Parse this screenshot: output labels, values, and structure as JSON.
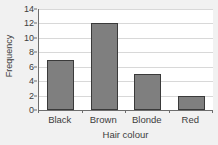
{
  "chart_data": {
    "type": "bar",
    "title": "",
    "subtitle": "",
    "categories": [
      "Black",
      "Brown",
      "Blonde",
      "Red"
    ],
    "values": [
      7,
      12,
      5,
      2
    ],
    "series": [
      {
        "name": "Frequency",
        "values": [
          7,
          12,
          5,
          2
        ]
      }
    ],
    "xlabel": "Hair colour",
    "ylabel": "Frequency",
    "ylim": [
      0,
      14
    ],
    "yticks": [
      0,
      2,
      4,
      6,
      8,
      10,
      12,
      14
    ],
    "ytick_labels": [
      "0",
      "2",
      "4",
      "6",
      "8",
      "10",
      "12",
      "14"
    ],
    "grid": true,
    "grid_axis": "y",
    "legend": false,
    "legend_position": "none",
    "annotations": [],
    "orientation": "vertical",
    "bar_color": "#7f7f7f",
    "bar_edge_color": "#3a3a3a",
    "plot_background": "#ffffff",
    "figure_background": "#f1f1f1",
    "gridline_color": "#d8d8d8",
    "axis_color": "#6d6d6d",
    "text_color": "#3d3d3d"
  }
}
